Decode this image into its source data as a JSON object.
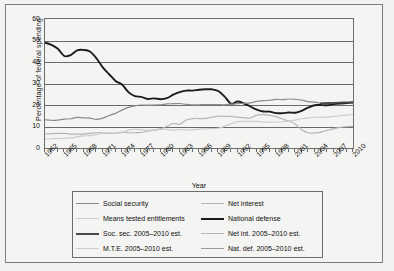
{
  "chart_data": {
    "type": "line",
    "title": "",
    "xlabel": "Year",
    "ylabel": "Percentage of federal spending",
    "xlim": [
      1962,
      2010
    ],
    "ylim": [
      0,
      60
    ],
    "ytick_labels": [
      "60",
      "50",
      "40",
      "30",
      "20",
      "10",
      "0"
    ],
    "ytick_values": [
      60,
      50,
      40,
      30,
      20,
      10,
      0
    ],
    "xtick_labels": [
      "1962",
      "1965",
      "1968",
      "1971",
      "1974",
      "1977",
      "1980",
      "1983",
      "1986",
      "1989",
      "1992",
      "1995",
      "1998",
      "2001",
      "2004",
      "2007",
      "2010"
    ],
    "xtick_values": [
      1962,
      1965,
      1968,
      1971,
      1974,
      1977,
      1980,
      1983,
      1986,
      1989,
      1992,
      1995,
      1998,
      2001,
      2004,
      2007,
      2010
    ],
    "grid": true,
    "legend_position": "bottom",
    "x": [
      1962,
      1963,
      1964,
      1965,
      1966,
      1967,
      1968,
      1969,
      1970,
      1971,
      1972,
      1973,
      1974,
      1975,
      1976,
      1977,
      1978,
      1979,
      1980,
      1981,
      1982,
      1983,
      1984,
      1985,
      1986,
      1987,
      1988,
      1989,
      1990,
      1991,
      1992,
      1993,
      1994,
      1995,
      1996,
      1997,
      1998,
      1999,
      2000,
      2001,
      2002,
      2003,
      2004,
      2005,
      2006,
      2007,
      2008,
      2009,
      2010
    ],
    "series": [
      {
        "name": "National defense",
        "color": "#1c1c1c",
        "width": 1.9,
        "values": [
          49.0,
          48.0,
          46.2,
          42.8,
          43.2,
          45.4,
          45.6,
          44.9,
          41.8,
          37.5,
          34.3,
          31.2,
          29.5,
          26.0,
          24.1,
          23.8,
          22.8,
          23.1,
          22.7,
          23.2,
          24.8,
          26.0,
          26.7,
          26.7,
          27.1,
          27.3,
          27.3,
          26.5,
          23.9,
          20.6,
          21.6,
          20.7,
          19.3,
          17.9,
          17.0,
          16.9,
          16.2,
          16.2,
          16.5,
          16.4,
          17.3,
          18.8,
          19.9,
          20.0,
          null,
          null,
          null,
          null,
          null
        ]
      },
      {
        "name": "Nat. def. 2005–2010 est.",
        "color": "#1c1c1c",
        "width": 1.9,
        "values": [
          null,
          null,
          null,
          null,
          null,
          null,
          null,
          null,
          null,
          null,
          null,
          null,
          null,
          null,
          null,
          null,
          null,
          null,
          null,
          null,
          null,
          null,
          null,
          null,
          null,
          null,
          null,
          null,
          null,
          null,
          null,
          null,
          null,
          null,
          null,
          null,
          null,
          null,
          null,
          null,
          null,
          null,
          null,
          20.0,
          19.9,
          20.4,
          20.7,
          20.9,
          21.1
        ]
      },
      {
        "name": "Social security",
        "color": "#8a8a8a",
        "width": 1.2,
        "values": [
          13.1,
          12.9,
          13.0,
          13.4,
          13.6,
          14.2,
          14.0,
          13.9,
          13.3,
          13.9,
          15.1,
          16.1,
          17.6,
          18.9,
          19.6,
          20.0,
          19.9,
          20.0,
          20.1,
          20.5,
          20.6,
          20.7,
          20.3,
          20.1,
          20.1,
          20.2,
          20.2,
          20.2,
          20.1,
          20.4,
          20.6,
          20.8,
          21.0,
          21.7,
          22.0,
          22.2,
          22.6,
          22.5,
          22.8,
          22.6,
          22.3,
          21.6,
          21.3,
          20.8,
          null,
          null,
          null,
          null,
          null
        ]
      },
      {
        "name": "Soc. sec. 2005–2010 est.",
        "color": "#4a4a4a",
        "width": 1.9,
        "values": [
          null,
          null,
          null,
          null,
          null,
          null,
          null,
          null,
          null,
          null,
          null,
          null,
          null,
          null,
          null,
          null,
          null,
          null,
          null,
          null,
          null,
          null,
          null,
          null,
          null,
          null,
          null,
          null,
          null,
          null,
          null,
          null,
          null,
          null,
          null,
          null,
          null,
          null,
          null,
          null,
          null,
          null,
          null,
          20.8,
          20.9,
          21.0,
          21.1,
          21.2,
          21.3
        ]
      },
      {
        "name": "Net interest",
        "color": "#b5b5b5",
        "width": 1.2,
        "values": [
          6.5,
          6.7,
          6.8,
          6.8,
          6.5,
          6.5,
          6.5,
          6.8,
          7.1,
          7.0,
          6.8,
          6.9,
          7.4,
          7.1,
          7.1,
          7.2,
          7.8,
          8.3,
          8.9,
          10.1,
          11.4,
          11.1,
          13.0,
          13.7,
          13.7,
          13.8,
          14.3,
          14.8,
          14.7,
          14.7,
          14.4,
          14.1,
          13.9,
          15.3,
          15.5,
          15.2,
          14.6,
          13.5,
          12.5,
          11.1,
          8.5,
          7.1,
          7.0,
          7.4,
          null,
          null,
          null,
          null,
          null
        ]
      },
      {
        "name": "Net int. 2005–2010 est.",
        "color": "#b5b5b5",
        "width": 1.2,
        "values": [
          null,
          null,
          null,
          null,
          null,
          null,
          null,
          null,
          null,
          null,
          null,
          null,
          null,
          null,
          null,
          null,
          null,
          null,
          null,
          null,
          null,
          null,
          null,
          null,
          null,
          null,
          null,
          null,
          null,
          null,
          null,
          null,
          null,
          null,
          null,
          null,
          null,
          null,
          null,
          null,
          null,
          null,
          null,
          7.4,
          8.2,
          9.0,
          9.6,
          9.9,
          10.1
        ]
      },
      {
        "name": "Means tested entitlements",
        "color": "#cdcdcd",
        "width": 1.2,
        "values": [
          4.0,
          4.3,
          4.4,
          4.5,
          4.7,
          5.2,
          5.6,
          5.8,
          6.2,
          6.9,
          7.0,
          6.9,
          7.2,
          8.3,
          8.7,
          8.5,
          8.3,
          8.3,
          8.6,
          8.7,
          8.2,
          8.6,
          8.4,
          8.5,
          8.7,
          8.9,
          9.0,
          9.2,
          10.1,
          11.3,
          12.3,
          12.4,
          12.4,
          12.4,
          12.1,
          12.0,
          12.0,
          12.2,
          12.5,
          13.0,
          13.6,
          14.0,
          14.3,
          14.2,
          null,
          null,
          null,
          null,
          null
        ]
      },
      {
        "name": "M.T.E. 2005–2010 est.",
        "color": "#cdcdcd",
        "width": 1.2,
        "values": [
          null,
          null,
          null,
          null,
          null,
          null,
          null,
          null,
          null,
          null,
          null,
          null,
          null,
          null,
          null,
          null,
          null,
          null,
          null,
          null,
          null,
          null,
          null,
          null,
          null,
          null,
          null,
          null,
          null,
          null,
          null,
          null,
          null,
          null,
          null,
          null,
          null,
          null,
          null,
          null,
          null,
          null,
          null,
          14.2,
          14.4,
          14.7,
          15.0,
          15.3,
          15.6
        ]
      }
    ]
  },
  "legend": {
    "left_column": [
      {
        "label": "Social security",
        "color": "#8a8a8a",
        "width": 1.2
      },
      {
        "label": "Means tested entitlements",
        "color": "#cdcdcd",
        "width": 1.2
      },
      {
        "label": "Soc. sec. 2005–2010 est.",
        "color": "#4a4a4a",
        "width": 2.2
      },
      {
        "label": "M.T.E. 2005–2010 est.",
        "color": "#cdcdcd",
        "width": 1.2
      }
    ],
    "right_column": [
      {
        "label": "Net interest",
        "color": "#b5b5b5",
        "width": 1.2
      },
      {
        "label": "National defense",
        "color": "#1c1c1c",
        "width": 2.2
      },
      {
        "label": "Net int. 2005–2010 est.",
        "color": "#b5b5b5",
        "width": 1.2
      },
      {
        "label": "Nat. def. 2005–2010 est.",
        "color": "#9a9a9a",
        "width": 1.2
      }
    ]
  }
}
